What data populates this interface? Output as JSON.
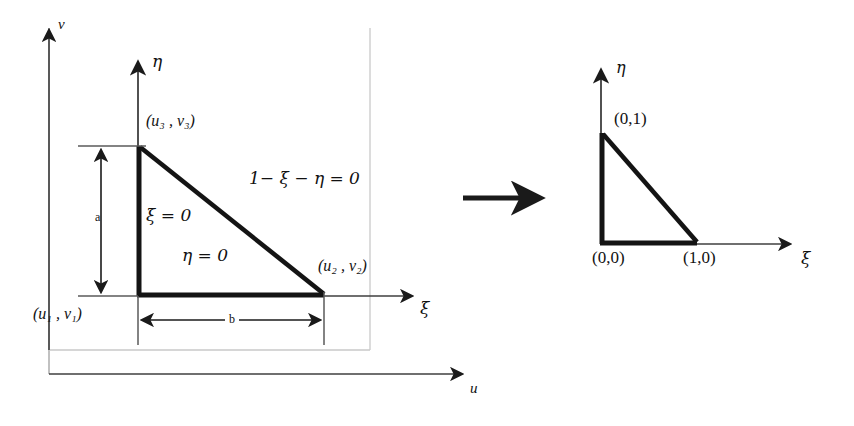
{
  "figure": {
    "left_diagram": {
      "name": "physical-element",
      "axes": [
        {
          "id": "v-axis",
          "label": "v",
          "orientation": "vertical"
        },
        {
          "id": "u-axis",
          "label": "u",
          "orientation": "horizontal"
        },
        {
          "id": "eta-axis",
          "label": "η",
          "orientation": "vertical"
        },
        {
          "id": "xi-axis",
          "label": "ξ",
          "orientation": "horizontal"
        }
      ],
      "vertices": [
        {
          "id": "vertex-1",
          "label": "(u₁ , v₁)",
          "u": "u₁",
          "v": "v₁"
        },
        {
          "id": "vertex-2",
          "label": "(u₂ , v₂)",
          "u": "u₂",
          "v": "v₂"
        },
        {
          "id": "vertex-3",
          "label": "(u₃ , v₃)",
          "u": "u₃",
          "v": "v₃"
        }
      ],
      "edge_equations": [
        {
          "id": "edge-xi-zero",
          "label": "ξ = 0"
        },
        {
          "id": "edge-eta-zero",
          "label": "η = 0"
        },
        {
          "id": "edge-hypotenuse",
          "label": "1− ξ − η = 0"
        }
      ],
      "dimensions": [
        {
          "id": "dimension-a",
          "label": "a",
          "direction": "vertical"
        },
        {
          "id": "dimension-b",
          "label": "b",
          "direction": "horizontal"
        }
      ]
    },
    "transition": {
      "name": "maps-to-arrow",
      "label": "→"
    },
    "right_diagram": {
      "name": "reference-element",
      "axes": [
        {
          "id": "eta-axis",
          "label": "η",
          "orientation": "vertical"
        },
        {
          "id": "xi-axis",
          "label": "ξ",
          "orientation": "horizontal"
        }
      ],
      "vertices": [
        {
          "id": "ref-vertex-origin",
          "label": "(0,0)"
        },
        {
          "id": "ref-vertex-xi",
          "label": "(1,0)"
        },
        {
          "id": "ref-vertex-eta",
          "label": "(0,1)"
        }
      ]
    },
    "colors": {
      "ink": "#111111",
      "thin_line": "#3a3a3a",
      "faint_line": "#9a9a9a",
      "background": "#ffffff"
    }
  }
}
